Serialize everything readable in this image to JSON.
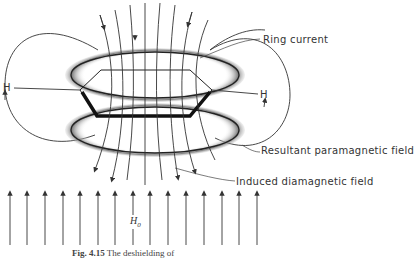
{
  "figure": {
    "caption_number": "Fig. 4.15",
    "caption_text": "The deshielding of"
  },
  "labels": {
    "ring_current": "Ring current",
    "resultant_field": "Resultant paramagnetic field",
    "induced_field": "Induced diamagnetic field",
    "h_left": "H",
    "h_right": "H",
    "h0_main": "H",
    "h0_sub": "0"
  },
  "colors": {
    "line": "#333333",
    "ring_shadow": "#9a9a9a",
    "benzene": "#111111"
  }
}
